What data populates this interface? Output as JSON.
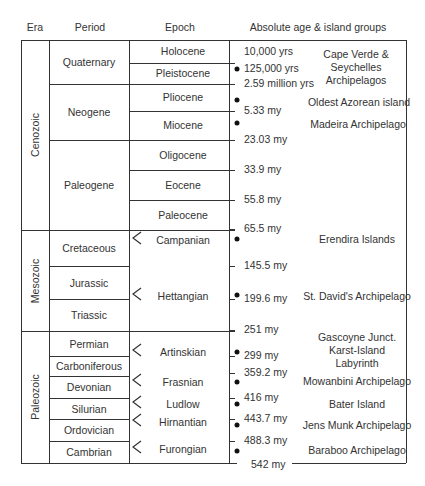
{
  "headers": {
    "era": "Era",
    "period": "Period",
    "epoch": "Epoch",
    "age": "Absolute age & island groups"
  },
  "eras": [
    {
      "name": "Cenozoic",
      "top": 40,
      "bottom": 230
    },
    {
      "name": "Mesozoic",
      "top": 230,
      "bottom": 331
    },
    {
      "name": "Paleozoic",
      "top": 331,
      "bottom": 463
    }
  ],
  "periods": [
    {
      "name": "Quaternary",
      "top": 40,
      "bottom": 84
    },
    {
      "name": "Neogene",
      "top": 84,
      "bottom": 140
    },
    {
      "name": "Paleogene",
      "top": 140,
      "bottom": 230
    },
    {
      "name": "Cretaceous",
      "top": 230,
      "bottom": 266
    },
    {
      "name": "Jurassic",
      "top": 266,
      "bottom": 299
    },
    {
      "name": "Triassic",
      "top": 299,
      "bottom": 331
    },
    {
      "name": "Permian",
      "top": 331,
      "bottom": 356
    },
    {
      "name": "Carboniferous",
      "top": 356,
      "bottom": 376
    },
    {
      "name": "Devonian",
      "top": 376,
      "bottom": 398
    },
    {
      "name": "Silurian",
      "top": 398,
      "bottom": 419
    },
    {
      "name": "Ordovician",
      "top": 419,
      "bottom": 441
    },
    {
      "name": "Cambrian",
      "top": 441,
      "bottom": 463
    }
  ],
  "epochs": [
    {
      "name": "Holocene",
      "y": 51
    },
    {
      "name": "Pleistocene",
      "y": 73
    },
    {
      "name": "Pliocene",
      "y": 97
    },
    {
      "name": "Miocene",
      "y": 125
    },
    {
      "name": "Oligocene",
      "y": 155
    },
    {
      "name": "Eocene",
      "y": 185
    },
    {
      "name": "Paleocene",
      "y": 215
    },
    {
      "name": "Campanian",
      "y": 240,
      "marker": true
    },
    {
      "name": "Hettangian",
      "y": 296,
      "marker": true
    },
    {
      "name": "Artinskian",
      "y": 352,
      "marker": true
    },
    {
      "name": "Frasnian",
      "y": 382,
      "marker": true
    },
    {
      "name": "Ludlow",
      "y": 404,
      "marker": true
    },
    {
      "name": "Hirnantian",
      "y": 422,
      "marker": true
    },
    {
      "name": "Furongian",
      "y": 449,
      "marker": true
    }
  ],
  "epoch_lines": [
    63,
    111,
    170,
    200
  ],
  "ages": [
    {
      "label": "10,000 yrs",
      "y": 52,
      "x": 244,
      "tick": false
    },
    {
      "label": "125,000 yrs",
      "y": 69,
      "x": 244,
      "tick": false
    },
    {
      "label": "2.59 million yrs",
      "y": 84,
      "x": 244,
      "tick": true
    },
    {
      "label": "5.33 my",
      "y": 111,
      "x": 244,
      "tick": true
    },
    {
      "label": "23.03 my",
      "y": 140,
      "x": 244,
      "tick": true
    },
    {
      "label": "33.9 my",
      "y": 170,
      "x": 244,
      "tick": true
    },
    {
      "label": "55.8 my",
      "y": 200,
      "x": 244,
      "tick": true
    },
    {
      "label": "65.5 my",
      "y": 229,
      "x": 244,
      "tick": true
    },
    {
      "label": "145.5 my",
      "y": 266,
      "x": 244,
      "tick": true
    },
    {
      "label": "199.6 my",
      "y": 299,
      "x": 244,
      "tick": true
    },
    {
      "label": "251 my",
      "y": 330,
      "x": 244,
      "tick": true
    },
    {
      "label": "299 my",
      "y": 356,
      "x": 244,
      "tick": true
    },
    {
      "label": "359.2 my",
      "y": 373,
      "x": 244,
      "tick": true
    },
    {
      "label": "416 my",
      "y": 398,
      "x": 244,
      "tick": true
    },
    {
      "label": "443.7 my",
      "y": 419,
      "x": 244,
      "tick": true
    },
    {
      "label": "488.3 my",
      "y": 441,
      "x": 244,
      "tick": true
    },
    {
      "label": "542 my",
      "y": 465,
      "x": 251,
      "tick": false
    }
  ],
  "dots": [
    {
      "x": 237,
      "y": 69
    },
    {
      "x": 237,
      "y": 100
    },
    {
      "x": 237,
      "y": 123
    },
    {
      "x": 237,
      "y": 239
    },
    {
      "x": 237,
      "y": 295
    },
    {
      "x": 237,
      "y": 352
    },
    {
      "x": 237,
      "y": 382
    },
    {
      "x": 237,
      "y": 404
    },
    {
      "x": 237,
      "y": 425
    },
    {
      "x": 237,
      "y": 451
    }
  ],
  "islands": [
    {
      "lines": [
        "Cape Verde &",
        "Seychelles",
        "Archipelagos"
      ],
      "x": 356,
      "y": 67
    },
    {
      "lines": [
        "Oldest Azorean island"
      ],
      "x": 359,
      "y": 102
    },
    {
      "lines": [
        "Madeira Archipelago"
      ],
      "x": 358,
      "y": 124
    },
    {
      "lines": [
        "Erendira Islands"
      ],
      "x": 357,
      "y": 239
    },
    {
      "lines": [
        "St. David's Archipelago"
      ],
      "x": 357,
      "y": 296
    },
    {
      "lines": [
        "Gascoyne Junct.",
        "Karst-Island",
        "Labyrinth"
      ],
      "x": 357,
      "y": 350
    },
    {
      "lines": [
        "Mowanbini Archipelago"
      ],
      "x": 357,
      "y": 381
    },
    {
      "lines": [
        "Bater Island"
      ],
      "x": 357,
      "y": 404
    },
    {
      "lines": [
        "Jens Munk Archipelago"
      ],
      "x": 357,
      "y": 425
    },
    {
      "lines": [
        "Baraboo Archipelago"
      ],
      "x": 357,
      "y": 450
    }
  ],
  "geometry": {
    "left": 21,
    "right": 406,
    "top": 40,
    "bottom": 463,
    "col_era": 49,
    "col_period": 129,
    "col_epoch": 229
  }
}
